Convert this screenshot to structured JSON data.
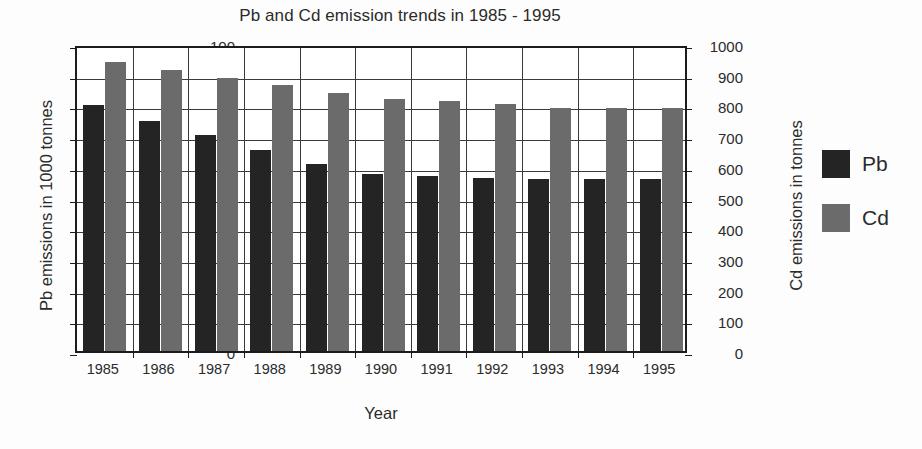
{
  "chart_data": {
    "type": "bar",
    "title": "Pb and Cd emission trends in 1985 - 1995",
    "xlabel": "Year",
    "ylabel": "Pb emissions in 1000 tonnes",
    "ylabel_right": "Cd emissions in tonnes",
    "categories": [
      "1985",
      "1986",
      "1987",
      "1988",
      "1989",
      "1990",
      "1991",
      "1992",
      "1993",
      "1994",
      "1995"
    ],
    "series": [
      {
        "name": "Pb",
        "axis": "left",
        "unit": "1000 tonnes",
        "color": "#242424",
        "values": [
          80,
          75,
          70.5,
          65.5,
          61,
          57.5,
          57,
          56.5,
          56,
          56,
          56
        ]
      },
      {
        "name": "Cd",
        "axis": "right",
        "unit": "tonnes",
        "color": "#6b6b6b",
        "values": [
          940,
          915,
          890,
          865,
          840,
          822,
          815,
          805,
          790,
          790,
          790
        ]
      }
    ],
    "ylim": [
      0,
      100
    ],
    "ylim_right": [
      0,
      1000
    ],
    "yticks": [
      "0",
      "10",
      "20",
      "30",
      "40",
      "50",
      "60",
      "70",
      "80",
      "90",
      "100"
    ],
    "yticks_right": [
      "0",
      "100",
      "200",
      "300",
      "400",
      "500",
      "600",
      "700",
      "800",
      "900",
      "1000"
    ],
    "grid": true,
    "legend_position": "right",
    "legend": [
      {
        "label": "Pb",
        "color": "#242424"
      },
      {
        "label": "Cd",
        "color": "#6b6b6b"
      }
    ]
  }
}
